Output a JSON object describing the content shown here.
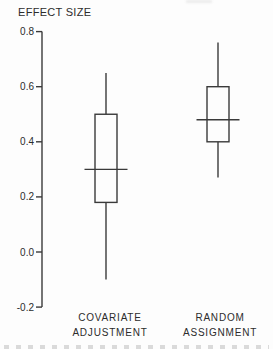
{
  "figure": {
    "title": "EFFECT SIZE"
  },
  "chart_data": {
    "type": "boxplot",
    "title": "EFFECT SIZE",
    "xlabel": "",
    "ylabel": "EFFECT SIZE",
    "ylim": [
      -0.2,
      0.8
    ],
    "yticks": [
      0.8,
      0.6,
      0.4,
      0.2,
      0.0,
      -0.2
    ],
    "ytick_labels": [
      "0.8",
      "0.6",
      "0.4",
      "0.2",
      "0.0",
      "-0.2"
    ],
    "grid": false,
    "legend": "none",
    "categories": [
      {
        "line1": "COVARIATE",
        "line2": "ADJUSTMENT"
      },
      {
        "line1": "RANDOM",
        "line2": "ASSIGNMENT"
      }
    ],
    "series": [
      {
        "name": "COVARIATE ADJUSTMENT",
        "whisker_low": -0.1,
        "q1": 0.18,
        "median": 0.3,
        "q3": 0.5,
        "whisker_high": 0.65
      },
      {
        "name": "RANDOM ASSIGNMENT",
        "whisker_low": 0.27,
        "q1": 0.4,
        "median": 0.48,
        "q3": 0.6,
        "whisker_high": 0.76
      }
    ],
    "colors": {
      "line": "#3a3a3a",
      "text": "#2c2c2c",
      "box_fill": "#fdfdfd",
      "background": "#fdfdfd"
    }
  }
}
